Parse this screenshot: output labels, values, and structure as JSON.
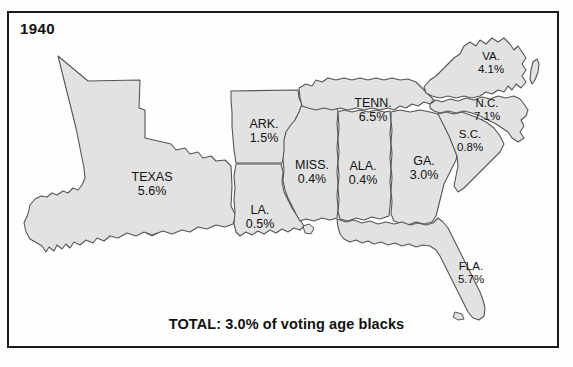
{
  "figure": {
    "year": "1940",
    "total_caption": "TOTAL: 3.0% of voting age blacks",
    "colors": {
      "state_fill": "#e2e2e2",
      "state_stroke": "#555555",
      "frame_border": "#1a1a1a",
      "background": "#fefefe",
      "text": "#111111"
    }
  },
  "map_data": {
    "type": "choropleth-map",
    "title": "1940",
    "unit": "percent",
    "caption": "TOTAL: 3.0% of voting age blacks",
    "states": [
      {
        "abbr": "TEXAS",
        "value": "5.6%",
        "label_x": 152,
        "label_y": 184
      },
      {
        "abbr": "ARK.",
        "value": "1.5%",
        "label_x": 264,
        "label_y": 131
      },
      {
        "abbr": "LA.",
        "value": "0.5%",
        "label_x": 260,
        "label_y": 217
      },
      {
        "abbr": "MISS.",
        "value": "0.4%",
        "label_x": 312,
        "label_y": 172
      },
      {
        "abbr": "ALA.",
        "value": "0.4%",
        "label_x": 363,
        "label_y": 173
      },
      {
        "abbr": "TENN.",
        "value": "6.5%",
        "label_x": 373,
        "label_y": 110
      },
      {
        "abbr": "GA.",
        "value": "3.0%",
        "label_x": 424,
        "label_y": 168
      },
      {
        "abbr": "FLA.",
        "value": "5.7%",
        "label_x": 471,
        "label_y": 273
      },
      {
        "abbr": "S.C.",
        "value": "0.8%",
        "label_x": 470,
        "label_y": 141
      },
      {
        "abbr": "N.C.",
        "value": "7.1%",
        "label_x": 487,
        "label_y": 110
      },
      {
        "abbr": "VA.",
        "value": "4.1%",
        "label_x": 491,
        "label_y": 63
      }
    ]
  }
}
